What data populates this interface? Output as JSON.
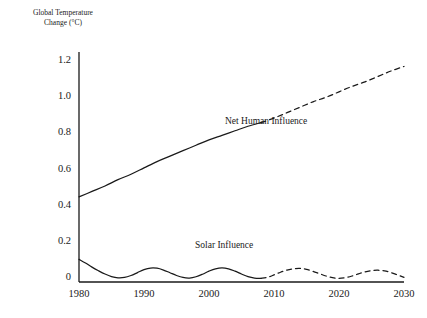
{
  "chart_data": {
    "type": "line",
    "title": "",
    "subtitle": "",
    "xlabel": "",
    "ylabel": "Global Temperature\nChange (°C)",
    "xlim": [
      1980,
      2030
    ],
    "ylim": [
      -0.02,
      1.25
    ],
    "xticks": [
      "1980",
      "1990",
      "2000",
      "2010",
      "2020",
      "2030"
    ],
    "xtick_values": [
      1980,
      1990,
      2000,
      2010,
      2020,
      2030
    ],
    "yticks": [
      "0",
      "0.2",
      "0.4",
      "0.6",
      "0.8",
      "1.0",
      "1.2"
    ],
    "ytick_values": [
      0,
      0.2,
      0.4,
      0.6,
      0.8,
      1.0,
      1.2
    ],
    "grid": false,
    "legend_position": "inline-annotations",
    "axis_style": "left-and-bottom-spines-only",
    "projection_start_year": 2008,
    "series": [
      {
        "name": "Net Human Influence",
        "label_x": 2012,
        "label_y": 0.86,
        "style_observed": "solid",
        "style_projected": "dashed",
        "x": [
          1980,
          1982,
          1984,
          1986,
          1988,
          1990,
          1992,
          1994,
          1996,
          1998,
          2000,
          2002,
          2004,
          2006,
          2008,
          2010,
          2012,
          2014,
          2016,
          2018,
          2020,
          2022,
          2024,
          2026,
          2028,
          2030
        ],
        "values": [
          0.45,
          0.48,
          0.51,
          0.545,
          0.575,
          0.61,
          0.645,
          0.675,
          0.705,
          0.735,
          0.765,
          0.79,
          0.815,
          0.84,
          0.86,
          0.885,
          0.915,
          0.945,
          0.975,
          1.0,
          1.03,
          1.06,
          1.085,
          1.115,
          1.145,
          1.17
        ]
      },
      {
        "name": "Solar Influence",
        "label_x": 2004,
        "label_y": 0.175,
        "style_observed": "solid",
        "style_projected": "dashed",
        "x": [
          1980,
          1981,
          1982,
          1983,
          1984,
          1985,
          1986,
          1987,
          1988,
          1989,
          1990,
          1991,
          1992,
          1993,
          1994,
          1995,
          1996,
          1997,
          1998,
          1999,
          2000,
          2001,
          2002,
          2003,
          2004,
          2005,
          2006,
          2007,
          2008,
          2009,
          2010,
          2011,
          2012,
          2013,
          2014,
          2015,
          2016,
          2017,
          2018,
          2019,
          2020,
          2021,
          2022,
          2023,
          2024,
          2025,
          2026,
          2027,
          2028,
          2029,
          2030
        ],
        "values": [
          0.105,
          0.085,
          0.062,
          0.042,
          0.024,
          0.01,
          0.003,
          0.005,
          0.016,
          0.032,
          0.048,
          0.057,
          0.056,
          0.046,
          0.031,
          0.016,
          0.005,
          0.002,
          0.009,
          0.023,
          0.04,
          0.053,
          0.058,
          0.053,
          0.04,
          0.024,
          0.01,
          0.002,
          0.0,
          0.006,
          0.019,
          0.034,
          0.046,
          0.053,
          0.055,
          0.05,
          0.039,
          0.026,
          0.013,
          0.004,
          0.0,
          0.004,
          0.013,
          0.025,
          0.036,
          0.043,
          0.045,
          0.041,
          0.032,
          0.019,
          0.006
        ]
      }
    ]
  },
  "annotations": {
    "net_human_influence": "Net Human Influence",
    "solar_influence": "Solar Influence"
  }
}
